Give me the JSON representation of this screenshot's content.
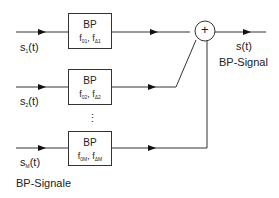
{
  "diagram": {
    "inputs": [
      {
        "label_base": "s",
        "label_sub": "1",
        "label_suffix": "(t)"
      },
      {
        "label_base": "s",
        "label_sub": "2",
        "label_suffix": "(t)"
      },
      {
        "label_base": "s",
        "label_sub": "M",
        "label_suffix": "(t)"
      }
    ],
    "filters": [
      {
        "title": "BP",
        "f0": "f",
        "f0_sub": "01",
        "sep": ", ",
        "fd": "f",
        "fd_sub": "Δ1"
      },
      {
        "title": "BP",
        "f0": "f",
        "f0_sub": "02",
        "sep": ", ",
        "fd": "f",
        "fd_sub": "Δ2"
      },
      {
        "title": "BP",
        "f0": "f",
        "f0_sub": "0M",
        "sep": ", ",
        "fd": "f",
        "fd_sub": "ΔM"
      }
    ],
    "ellipsis": "⋮",
    "summer_symbol": "+",
    "output_label": "s(t)",
    "output_caption": "BP-Signal",
    "inputs_caption": "BP-Signale"
  }
}
